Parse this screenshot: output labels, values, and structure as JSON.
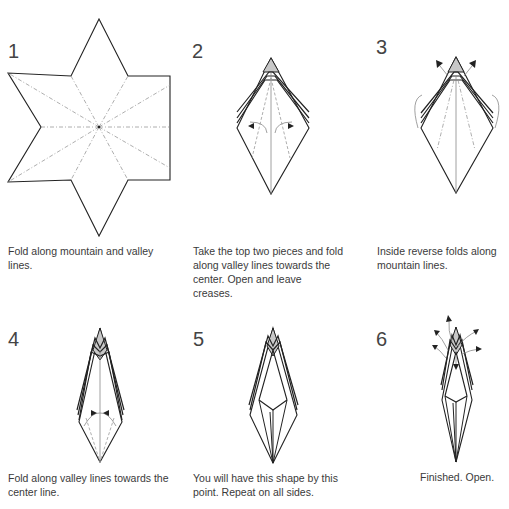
{
  "steps": [
    {
      "number": "1",
      "caption": "Fold along mountain and valley lines."
    },
    {
      "number": "2",
      "caption": "Take the top two pieces and fold along valley lines towards the center. Open and leave creases."
    },
    {
      "number": "3",
      "caption": "Inside reverse folds along mountain lines."
    },
    {
      "number": "4",
      "caption": "Fold along valley lines towards the center line."
    },
    {
      "number": "5",
      "caption": "You will have this shape by this point. Repeat on all sides."
    },
    {
      "number": "6",
      "caption": "Finished. Open."
    }
  ],
  "colors": {
    "line": "#222222",
    "fold_line": "#999999",
    "shaded": "#c8c8c8",
    "text": "#3a3a3a"
  }
}
